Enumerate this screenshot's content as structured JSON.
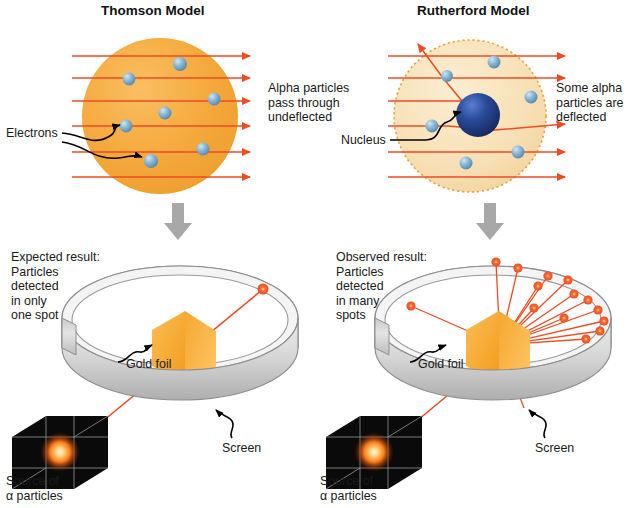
{
  "figure": {
    "type": "scientific-diagram",
    "width": 633,
    "height": 508
  },
  "panels": {
    "top_left": {
      "title": "Thomson Model",
      "atom_fill": "#f5a93c",
      "electron_color": "#6f9fc4",
      "beam_color": "#ef4b23",
      "callout_label": "Electrons",
      "result_text": "Alpha particles\npass through\nundeflected",
      "electron_count": 7,
      "beam_count": 6
    },
    "top_right": {
      "title": "Rutherford Model",
      "atom_fill": "#f7dfb4",
      "atom_border": "#e8a33d",
      "nucleus_color": "#223f83",
      "electron_color": "#6f9fc4",
      "beam_color": "#ef4b23",
      "callout_label": "Nucleus",
      "result_text": "Some alpha\nparticles are\ndeflected",
      "electron_count": 6,
      "beam_count": 6,
      "deflected_beam_count": 2
    },
    "bottom_left": {
      "result_text": "Expected result:\nParticles\ndetected\nin only\none spot",
      "foil_label": "Gold foil",
      "screen_label": "Screen",
      "source_label": "Source of\nα particles",
      "foil_color": "#f7a62c",
      "screen_color": "#d9d9d9",
      "ray_color": "#ef4b23",
      "spot_count": 1
    },
    "bottom_right": {
      "result_text": "Observed result:\nParticles\ndetected\nin many\nspots",
      "foil_label": "Gold foil",
      "screen_label": "Screen",
      "source_label": "Source of\nα particles",
      "foil_color": "#f7a62c",
      "screen_color": "#d9d9d9",
      "ray_color": "#ef4b23",
      "spot_count": 15
    }
  },
  "colors": {
    "beam": "#ef4b23",
    "beam_light": "#f2603c",
    "arrow_gray": "#a8a8a8",
    "leader_black": "#000000",
    "text": "#1a1a1a",
    "thomson_sphere": "#f5a93c",
    "rutherford_cloud": "#f7dfb4",
    "nucleus_dark": "#1b3370",
    "nucleus_mid": "#2b4d9c",
    "electron_mid": "#6f9fc4",
    "electron_light": "#a9cde4",
    "foil_front": "#f6a52b",
    "foil_back": "#f2b64f",
    "metal_light": "#f0f0f0",
    "metal_mid": "#cfcfcf",
    "metal_dark": "#9a9a9a",
    "source_box": "#090909",
    "source_glow": "#ff7a18"
  },
  "transition_arrows": {
    "count": 2,
    "direction": "down",
    "color": "#a8a8a8"
  }
}
